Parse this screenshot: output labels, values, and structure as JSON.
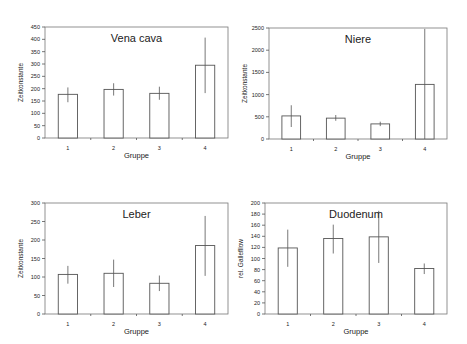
{
  "chart_data": [
    {
      "type": "bar",
      "title": "Vena cava",
      "xlabel": "Gruppe",
      "ylabel": "Zeitkonstante",
      "categories": [
        "1",
        "2",
        "3",
        "4"
      ],
      "values": [
        177,
        197,
        181,
        295
      ],
      "error_low": [
        145,
        172,
        155,
        182
      ],
      "error_high": [
        205,
        222,
        208,
        407
      ],
      "ylim": [
        0,
        450
      ],
      "yticks": [
        0,
        50,
        100,
        150,
        200,
        250,
        300,
        350,
        400,
        450
      ],
      "grid": false,
      "frame": {
        "x": 45,
        "y": 27,
        "w": 183,
        "h": 111
      }
    },
    {
      "type": "bar",
      "title": "Niere",
      "xlabel": "Gruppe",
      "ylabel": "Zeitkonstante",
      "categories": [
        "1",
        "2",
        "3",
        "4"
      ],
      "values": [
        520,
        470,
        340,
        1230
      ],
      "error_low": [
        270,
        410,
        290,
        0
      ],
      "error_high": [
        760,
        540,
        390,
        2480
      ],
      "ylim": [
        0,
        2500
      ],
      "yticks": [
        0,
        500,
        1000,
        1500,
        2000,
        2500
      ],
      "grid": false,
      "frame": {
        "x": 269,
        "y": 28,
        "w": 178,
        "h": 111
      }
    },
    {
      "type": "bar",
      "title": "Leber",
      "xlabel": "Gruppe",
      "ylabel": "Zeitkonstante",
      "categories": [
        "1",
        "2",
        "3",
        "4"
      ],
      "values": [
        107,
        110,
        83,
        185
      ],
      "error_low": [
        82,
        73,
        62,
        103
      ],
      "error_high": [
        130,
        147,
        104,
        265
      ],
      "ylim": [
        0,
        300
      ],
      "yticks": [
        0,
        50,
        100,
        150,
        200,
        250,
        300
      ],
      "grid": false,
      "frame": {
        "x": 45,
        "y": 203,
        "w": 183,
        "h": 111
      }
    },
    {
      "type": "bar",
      "title": "Duodenum",
      "xlabel": "Gruppe",
      "ylabel": "rel. Gallefllow",
      "categories": [
        "1",
        "2",
        "3",
        "4"
      ],
      "values": [
        119,
        136,
        139,
        82
      ],
      "error_low": [
        85,
        109,
        92,
        72
      ],
      "error_high": [
        152,
        161,
        186,
        91
      ],
      "ylim": [
        0,
        200
      ],
      "yticks": [
        0,
        20,
        40,
        60,
        80,
        100,
        120,
        140,
        160,
        180,
        200
      ],
      "grid": false,
      "frame": {
        "x": 265,
        "y": 203,
        "w": 182,
        "h": 111
      }
    }
  ]
}
